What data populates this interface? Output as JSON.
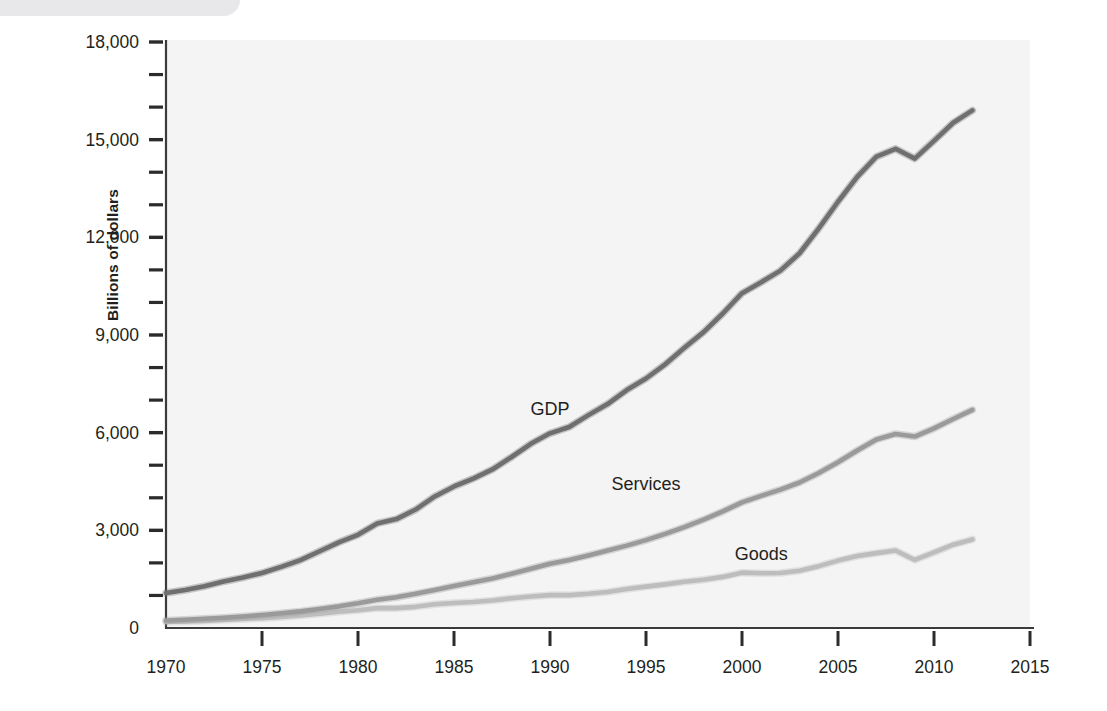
{
  "chart_data": {
    "type": "line",
    "title": "",
    "subtitle": "",
    "xlabel": "",
    "ylabel": "Billions of dollars",
    "xlim": [
      1970,
      2015
    ],
    "ylim": [
      0,
      18000
    ],
    "grid": false,
    "legend_position": "inline-annotations",
    "x_ticks": [
      "1970",
      "1975",
      "1980",
      "1985",
      "1990",
      "1995",
      "2000",
      "2005",
      "2010",
      "2015"
    ],
    "x_tick_values": [
      1970,
      1975,
      1980,
      1985,
      1990,
      1995,
      2000,
      2005,
      2010,
      2015
    ],
    "y_ticks": [
      "0",
      "3,000",
      "6,000",
      "9,000",
      "12,000",
      "15,000",
      "18,000"
    ],
    "y_tick_values": [
      0,
      3000,
      6000,
      9000,
      12000,
      15000,
      18000
    ],
    "y_minor_tick_values": [
      1000,
      2000,
      4000,
      5000,
      7000,
      8000,
      10000,
      11000,
      13000,
      14000,
      16000,
      17000
    ],
    "x": [
      1970,
      1971,
      1972,
      1973,
      1974,
      1975,
      1976,
      1977,
      1978,
      1979,
      1980,
      1981,
      1982,
      1983,
      1984,
      1985,
      1986,
      1987,
      1988,
      1989,
      1990,
      1991,
      1992,
      1993,
      1994,
      1995,
      1996,
      1997,
      1998,
      1999,
      2000,
      2001,
      2002,
      2003,
      2004,
      2005,
      2006,
      2007,
      2008,
      2009,
      2010,
      2011,
      2012
    ],
    "series": [
      {
        "name": "GDP",
        "color": "#6f6f6f",
        "label_x": 1990,
        "label_y": 6550,
        "values": [
          1076,
          1168,
          1282,
          1429,
          1549,
          1689,
          1878,
          2086,
          2357,
          2632,
          2863,
          3211,
          3345,
          3638,
          4041,
          4347,
          4590,
          4870,
          5253,
          5658,
          5980,
          6174,
          6539,
          6879,
          7309,
          7664,
          8100,
          8609,
          9089,
          9661,
          10285,
          10622,
          10978,
          11511,
          12275,
          13094,
          13856,
          14478,
          14719,
          14419,
          14964,
          15518,
          15900
        ]
      },
      {
        "name": "Services",
        "color": "#9a9a9a",
        "label_x": 1995,
        "label_y": 4250,
        "values": [
          230,
          255,
          283,
          315,
          352,
          400,
          451,
          510,
          584,
          665,
          760,
          870,
          945,
          1050,
          1165,
          1290,
          1405,
          1520,
          1665,
          1820,
          1975,
          2090,
          2230,
          2380,
          2530,
          2700,
          2890,
          3100,
          3330,
          3580,
          3860,
          4060,
          4250,
          4470,
          4760,
          5090,
          5450,
          5790,
          5960,
          5880,
          6130,
          6420,
          6700
        ]
      },
      {
        "name": "Goods",
        "color": "#bdbdbd",
        "label_x": 2001,
        "label_y": 2100,
        "values": [
          190,
          200,
          220,
          250,
          280,
          300,
          340,
          385,
          440,
          500,
          545,
          610,
          610,
          650,
          730,
          770,
          800,
          845,
          915,
          970,
          1010,
          1010,
          1050,
          1105,
          1200,
          1270,
          1340,
          1420,
          1480,
          1570,
          1700,
          1680,
          1690,
          1760,
          1900,
          2070,
          2210,
          2300,
          2380,
          2090,
          2320,
          2560,
          2720
        ]
      }
    ],
    "annotations": [
      {
        "text": "GDP",
        "x": 1990,
        "y": 6550
      },
      {
        "text": "Services",
        "x": 1995,
        "y": 4250
      },
      {
        "text": "Goods",
        "x": 2001,
        "y": 2100
      }
    ]
  }
}
